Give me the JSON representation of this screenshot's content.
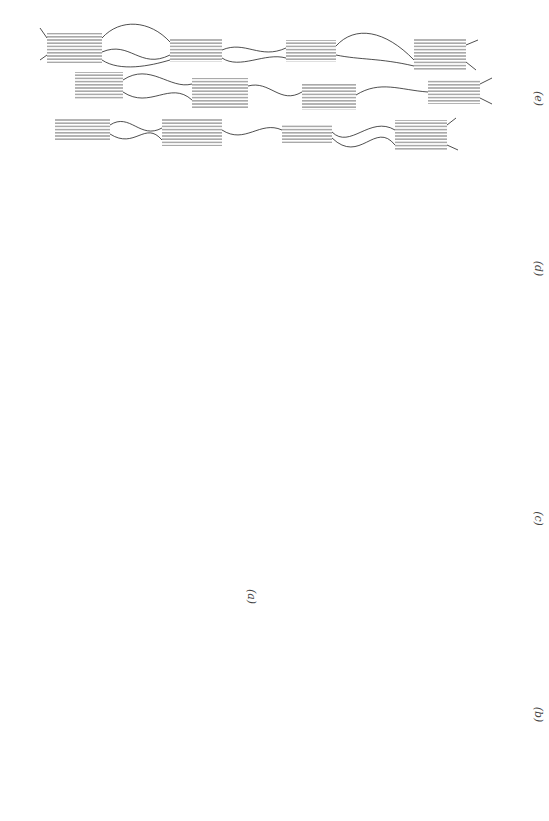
{
  "figure": {
    "orientation": "rotated 90 degrees clockwise",
    "panels": [
      {
        "id": "a",
        "label": "(a)",
        "state": "initial stacked lamellae with amorphous interlayer",
        "tensile_arrows": true
      },
      {
        "id": "b",
        "label": "(b)",
        "state": "amorphous tie chains extended, lamellae separating"
      },
      {
        "id": "c",
        "label": "(c)",
        "state": "interlamellar shear and further chain extension"
      },
      {
        "id": "d",
        "label": "(d)",
        "state": "lamellae fragmenting into crystalline blocks"
      },
      {
        "id": "e",
        "label": "(e)",
        "state": "fibrillar structure of aligned blocks connected by tie molecules"
      }
    ],
    "arrows": [
      {
        "direction": "left",
        "meaning": "applied tension"
      },
      {
        "direction": "right",
        "meaning": "applied tension"
      }
    ]
  },
  "colors": {
    "lamella": "#555555",
    "chain": "#222222",
    "background": "#ffffff"
  }
}
